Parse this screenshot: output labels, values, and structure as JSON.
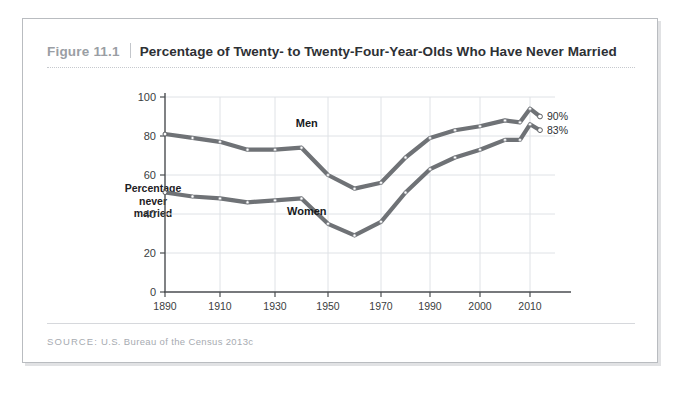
{
  "figure": {
    "number": "Figure 11.1",
    "title": "Percentage of Twenty- to Twenty-Four-Year-Olds Who Have Never Married",
    "source_label": "SOURCE:",
    "source_text": "U.S. Bureau of the Census 2013c"
  },
  "chart_data": {
    "type": "line",
    "title": "Percentage of Twenty- to Twenty-Four-Year-Olds Who Have Never Married",
    "xlabel": "",
    "ylabel": "Percentage never married",
    "ylabel_lines": [
      "Percentage",
      "never",
      "married"
    ],
    "ylim": [
      0,
      100
    ],
    "yticks": [
      0,
      20,
      40,
      60,
      80,
      100
    ],
    "xticks": [
      1890,
      1910,
      1930,
      1950,
      1970,
      1990,
      2000,
      2010
    ],
    "xtick_labels": [
      "1890",
      "1910",
      "1930",
      "1950",
      "1970",
      "1990",
      "2000",
      "2010"
    ],
    "grid": true,
    "legend": "inline-labels",
    "x": [
      1890,
      1900,
      1910,
      1920,
      1930,
      1940,
      1950,
      1960,
      1970,
      1980,
      1990,
      1995,
      2000,
      2005,
      2008,
      2010,
      2012
    ],
    "series": [
      {
        "name": "Men",
        "label": "Men",
        "color": "#6f7276",
        "values": [
          81,
          79,
          77,
          73,
          73,
          74,
          60,
          53,
          56,
          69,
          79,
          83,
          85,
          88,
          87,
          94,
          90
        ],
        "end_value_label": "90%"
      },
      {
        "name": "Women",
        "label": "Women",
        "color": "#6f7276",
        "values": [
          51,
          49,
          48,
          46,
          47,
          48,
          35,
          29,
          36,
          51,
          63,
          69,
          73,
          78,
          78,
          86,
          83
        ],
        "end_value_label": "83%"
      }
    ],
    "annotations": [
      {
        "name": "men-series-label",
        "text": "Men",
        "x": 1942,
        "y": 81
      },
      {
        "name": "women-series-label",
        "text": "Women",
        "x": 1942,
        "y": 36
      },
      {
        "name": "men-end-label",
        "text": "90%",
        "x": 2012,
        "y": 90
      },
      {
        "name": "women-end-label",
        "text": "83%",
        "x": 2012,
        "y": 83
      }
    ]
  }
}
